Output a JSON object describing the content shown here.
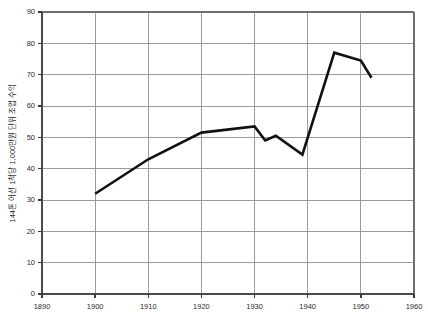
{
  "chart_data": {
    "type": "line",
    "title": "",
    "subtitle": "",
    "xlabel": "",
    "ylabel": "144톤 어선 1척당 1,000만원 단위 조업 수익",
    "xlim": [
      1890,
      1960
    ],
    "ylim": [
      0,
      90
    ],
    "grid": true,
    "legend": "none",
    "x_ticks": [
      1890,
      1900,
      1910,
      1920,
      1930,
      1940,
      1950,
      1960
    ],
    "x_tick_labels": [
      "1890",
      "1900",
      "1910",
      "1920",
      "1930",
      "1940",
      "1950",
      "1960"
    ],
    "y_ticks": [
      0,
      10,
      20,
      30,
      40,
      50,
      60,
      70,
      80,
      90
    ],
    "y_tick_labels": [
      "0",
      "10",
      "20",
      "30",
      "40",
      "50",
      "60",
      "70",
      "80",
      "90"
    ],
    "series": [
      {
        "name": "조업 수익",
        "color": "#111111",
        "x": [
          1900,
          1910,
          1920,
          1930,
          1932,
          1934,
          1939,
          1945,
          1950,
          1952
        ],
        "values": [
          32,
          43,
          51.5,
          53.5,
          49,
          50.5,
          44.5,
          77,
          74.5,
          69
        ]
      }
    ]
  },
  "axes": {
    "y_axis_label": "144톤 어선 1척당 1,000만원 단위 조업 수익"
  }
}
